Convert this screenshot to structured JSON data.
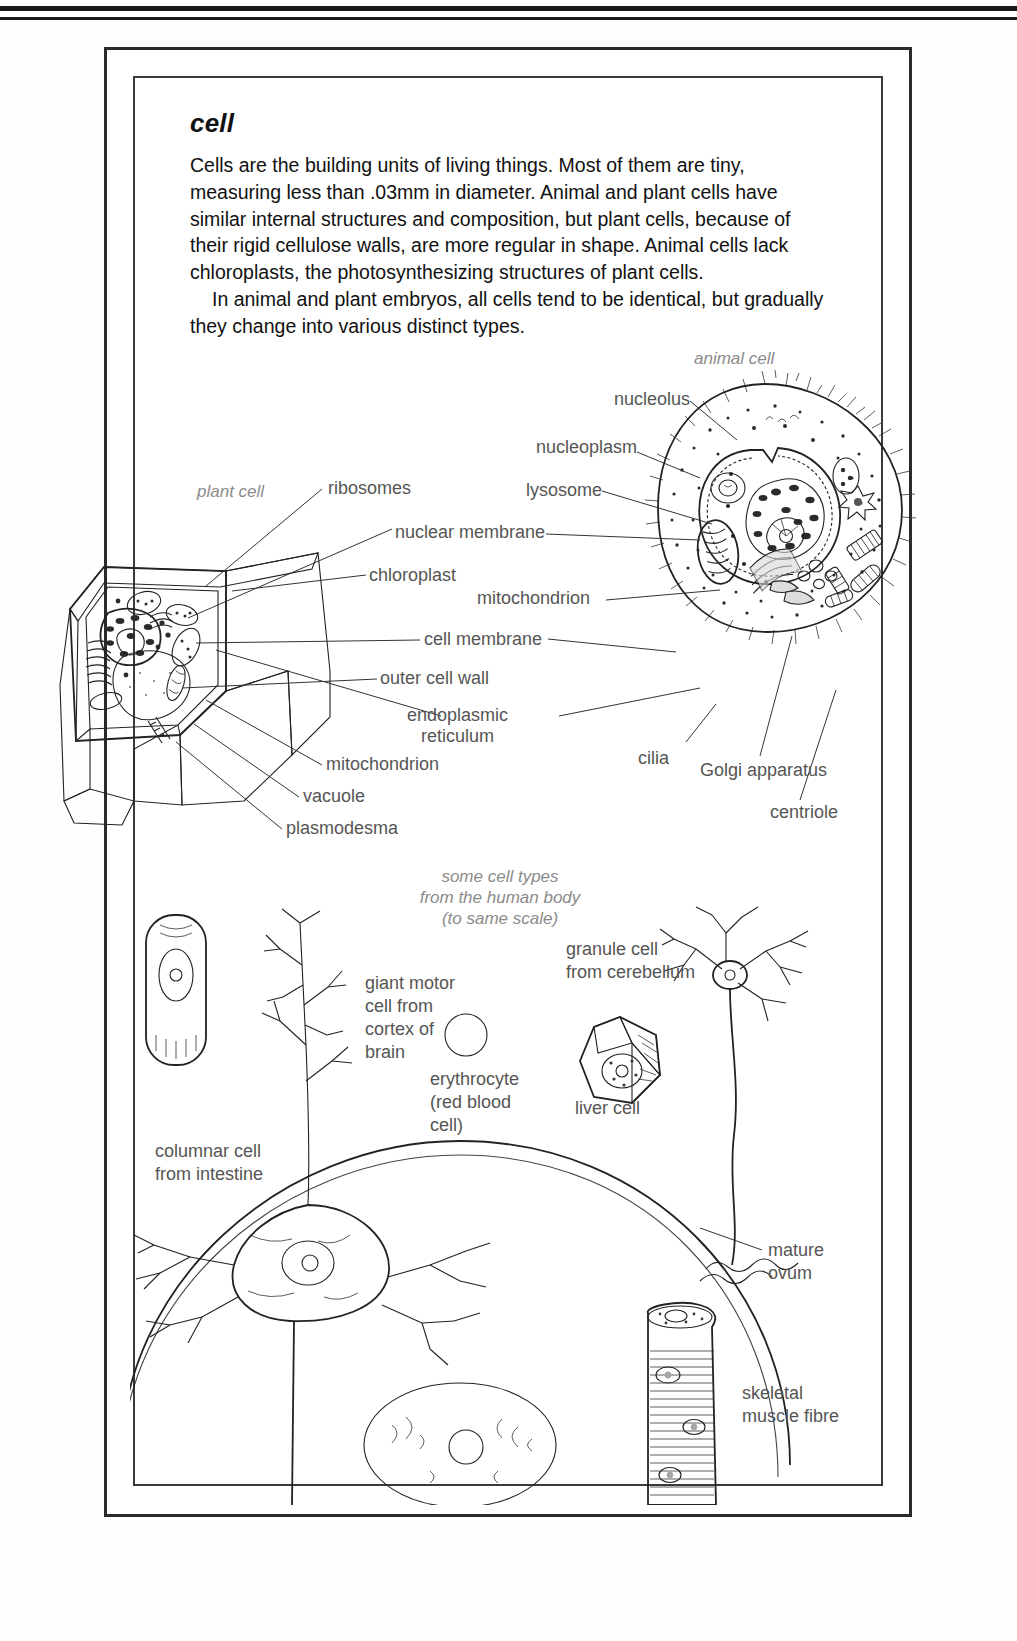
{
  "article": {
    "headword": "cell",
    "paragraphs": [
      "Cells are the building units of living things. Most of them are tiny, measuring less than .03mm in diameter. Animal and plant cells have similar internal structures and composition, but plant cells, because of their rigid cellulose walls, are more regular in shape. Animal cells lack chloroplasts, the photosynthesizing structures of plant cells.",
      "In animal and plant embryos, all cells tend to be identical, but gradually they change into various distinct types."
    ]
  },
  "diagrams": {
    "animal_cell_caption": "animal cell",
    "plant_cell_caption": "plant cell",
    "human_cells_caption": "some cell types\nfrom the human body\n(to same scale)"
  },
  "labels": {
    "nucleolus": "nucleolus",
    "nucleoplasm": "nucleoplasm",
    "lysosome": "lysosome",
    "ribosomes": "ribosomes",
    "nuclear_membrane": "nuclear membrane",
    "chloroplast": "chloroplast",
    "mitochondrion_right": "mitochondrion",
    "cell_membrane": "cell membrane",
    "outer_cell_wall": "outer cell wall",
    "endoplasmic_reticulum": "endoplasmic\nreticulum",
    "mitochondrion_left": "mitochondrion",
    "vacuole": "vacuole",
    "plasmodesma": "plasmodesma",
    "cilia": "cilia",
    "golgi_apparatus": "Golgi apparatus",
    "centriole": "centriole"
  },
  "cell_types": {
    "columnar": "columnar cell\nfrom intestine",
    "giant_motor": "giant motor\ncell from\ncortex of\nbrain",
    "erythrocyte": "erythrocyte\n(red blood\ncell)",
    "liver": "liver cell",
    "granule": "granule cell\nfrom cerebellum",
    "mature_ovum": "mature\novum",
    "skeletal_muscle": "skeletal\nmuscle fibre"
  },
  "colors": {
    "ink": "#222222",
    "label_gray": "#555555",
    "caption_gray": "#8b8b8b",
    "cell_fill": "#e8e8e8",
    "shade_mid": "#b9b9b9",
    "shade_dark": "#8f8f8f"
  }
}
